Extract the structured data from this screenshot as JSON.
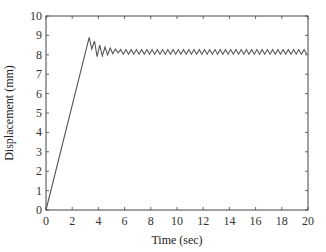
{
  "chart_data": {
    "type": "line",
    "title": "",
    "xlabel": "Time (sec)",
    "ylabel": "Displacement (mm)",
    "xlim": [
      0,
      20
    ],
    "ylim": [
      0,
      10
    ],
    "xticks": [
      0,
      2,
      4,
      6,
      8,
      10,
      12,
      14,
      16,
      18,
      20
    ],
    "yticks": [
      0,
      1,
      2,
      3,
      4,
      5,
      6,
      7,
      8,
      9,
      10
    ],
    "grid": false,
    "legend": null,
    "series": [
      {
        "name": "Displacement",
        "color": "#555555",
        "description": "Linear ramp from 0 to peak ~8.9 mm at ~3.3 s, damped oscillation, then steady state ~8.15 mm with small persistent ripple (~±0.1 mm)",
        "x": [
          0,
          3.3,
          3.5,
          3.7,
          3.9,
          4.1,
          4.3,
          4.5,
          4.7,
          4.9,
          5.1,
          5.3,
          5.5,
          6.0,
          8.0,
          10.0,
          12.0,
          14.0,
          16.0,
          18.0,
          20.0
        ],
        "y": [
          0,
          8.9,
          8.3,
          8.7,
          7.9,
          8.5,
          7.95,
          8.4,
          8.0,
          8.35,
          8.05,
          8.3,
          8.1,
          8.15,
          8.15,
          8.15,
          8.15,
          8.15,
          8.15,
          8.15,
          8.15
        ],
        "steady_state": 8.15,
        "ripple_amplitude": 0.12
      }
    ]
  }
}
